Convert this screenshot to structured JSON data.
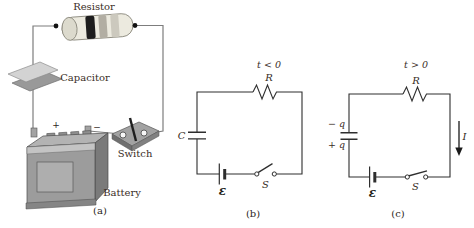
{
  "figure": {
    "background_color": "#ffffff",
    "schematic_line_color": "#2e2e2e",
    "label_color": "#3a2d26",
    "panel_a": {
      "caption": "(a)",
      "resistor_label": "Resistor",
      "capacitor_label": "Capacitor",
      "switch_label": "Switch",
      "battery_label": "Battery",
      "battery_plus_sign": "+",
      "battery_minus_sign": "−"
    },
    "panel_b": {
      "caption": "(b)",
      "time_condition": "t < 0",
      "resistance_label": "R",
      "capacitance_label": "C",
      "emf_label": "ε",
      "switch_label": "S"
    },
    "panel_c": {
      "caption": "(c)",
      "time_condition": "t > 0",
      "resistance_label": "R",
      "charge_top_label": "− q",
      "charge_bottom_label": "+ q",
      "emf_label": "ε",
      "switch_label": "S",
      "current_label": "I"
    }
  }
}
